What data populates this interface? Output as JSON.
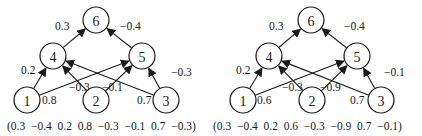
{
  "diagrams": [
    {
      "name": "network-a",
      "nodes": [
        {
          "id": "1",
          "label": "1",
          "x": 27,
          "y": 100
        },
        {
          "id": "2",
          "label": "2",
          "x": 96,
          "y": 100
        },
        {
          "id": "3",
          "label": "3",
          "x": 166,
          "y": 100
        },
        {
          "id": "4",
          "label": "4",
          "x": 53,
          "y": 56
        },
        {
          "id": "5",
          "label": "5",
          "x": 142,
          "y": 56
        },
        {
          "id": "6",
          "label": "6",
          "x": 96,
          "y": 20
        }
      ],
      "edges": [
        {
          "from": "4",
          "to": "6",
          "weight": "0.3",
          "lx": 55,
          "ly": 30
        },
        {
          "from": "5",
          "to": "6",
          "weight": "−0.4",
          "lx": 120,
          "ly": 30
        },
        {
          "from": "1",
          "to": "4",
          "weight": "0.2",
          "lx": 21,
          "ly": 74
        },
        {
          "from": "1",
          "to": "5",
          "weight": "0.8",
          "lx": 42,
          "ly": 104
        },
        {
          "from": "2",
          "to": "4",
          "weight": "−0.3",
          "lx": 69,
          "ly": 91
        },
        {
          "from": "2",
          "to": "5",
          "weight": "−0.1",
          "lx": 102,
          "ly": 91
        },
        {
          "from": "3",
          "to": "4",
          "weight": "0.7",
          "lx": 137,
          "ly": 104
        },
        {
          "from": "3",
          "to": "5",
          "weight": "−0.3",
          "lx": 171,
          "ly": 76
        }
      ],
      "caption": "(0.3  −0.4  0.2  0.8  −0.3  −0.1  0.7  −0.3)",
      "caption_x": 7,
      "caption_y": 130
    },
    {
      "name": "network-b",
      "nodes": [
        {
          "id": "1",
          "label": "1",
          "x": 243,
          "y": 100
        },
        {
          "id": "2",
          "label": "2",
          "x": 312,
          "y": 100
        },
        {
          "id": "3",
          "label": "3",
          "x": 381,
          "y": 100
        },
        {
          "id": "4",
          "label": "4",
          "x": 269,
          "y": 56
        },
        {
          "id": "5",
          "label": "5",
          "x": 357,
          "y": 56
        },
        {
          "id": "6",
          "label": "6",
          "x": 311,
          "y": 20
        }
      ],
      "edges": [
        {
          "from": "4",
          "to": "6",
          "weight": "0.3",
          "lx": 269,
          "ly": 30
        },
        {
          "from": "5",
          "to": "6",
          "weight": "−0.4",
          "lx": 344,
          "ly": 30
        },
        {
          "from": "1",
          "to": "4",
          "weight": "0.2",
          "lx": 236,
          "ly": 74
        },
        {
          "from": "1",
          "to": "5",
          "weight": "0.6",
          "lx": 257,
          "ly": 104
        },
        {
          "from": "2",
          "to": "4",
          "weight": "−0.3",
          "lx": 282,
          "ly": 91
        },
        {
          "from": "2",
          "to": "5",
          "weight": "−0.9",
          "lx": 320,
          "ly": 91
        },
        {
          "from": "3",
          "to": "4",
          "weight": "0.7",
          "lx": 350,
          "ly": 104
        },
        {
          "from": "3",
          "to": "5",
          "weight": "−0.1",
          "lx": 384,
          "ly": 76
        }
      ],
      "caption": "(0.3  −0.4  0.2  0.6  −0.3  −0.9  0.7  −0.1)",
      "caption_x": 213,
      "caption_y": 130
    }
  ],
  "node_radius": 13,
  "colors": {
    "stroke": "#1a1a1a",
    "fill": "#ffffff"
  }
}
